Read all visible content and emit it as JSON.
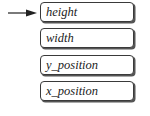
{
  "diagram": {
    "type": "stack",
    "pointer": "top",
    "items": [
      {
        "label": "height"
      },
      {
        "label": "width"
      },
      {
        "label": "y_position"
      },
      {
        "label": "x_position"
      }
    ]
  }
}
